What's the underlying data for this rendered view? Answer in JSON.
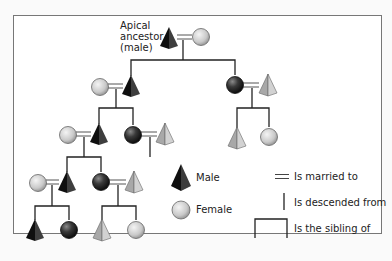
{
  "diagram": {
    "type": "kinship-descent-chart",
    "apical_label": [
      "Apical",
      "ancestor",
      "(male)"
    ],
    "colors": {
      "male_dark": "#1a1a1a",
      "male_light": "#bdbdbd",
      "female_light": "#d4d4d4",
      "female_dark": "#2e2e2e",
      "line": "#222222",
      "frame": "#777777"
    },
    "nodes": [
      {
        "id": "apex-m",
        "sex": "male",
        "shade": "dark",
        "x": 169,
        "y": 38
      },
      {
        "id": "apex-f",
        "sex": "female",
        "shade": "light",
        "x": 201,
        "y": 37
      },
      {
        "id": "g2-lf",
        "sex": "female",
        "shade": "light",
        "x": 100,
        "y": 87
      },
      {
        "id": "g2-lm",
        "sex": "male",
        "shade": "dark",
        "x": 131,
        "y": 86
      },
      {
        "id": "g2-rf",
        "sex": "female",
        "shade": "dark",
        "x": 235,
        "y": 85
      },
      {
        "id": "g2-rm",
        "sex": "male",
        "shade": "light",
        "x": 268,
        "y": 85
      },
      {
        "id": "g3-llf",
        "sex": "female",
        "shade": "light",
        "x": 68,
        "y": 135
      },
      {
        "id": "g3-llm",
        "sex": "male",
        "shade": "dark",
        "x": 99,
        "y": 134
      },
      {
        "id": "g3-lrf",
        "sex": "female",
        "shade": "dark",
        "x": 133,
        "y": 135
      },
      {
        "id": "g3-lrm",
        "sex": "male",
        "shade": "light",
        "x": 165,
        "y": 134
      },
      {
        "id": "g3-rm",
        "sex": "male",
        "shade": "light",
        "x": 237,
        "y": 138
      },
      {
        "id": "g3-rf",
        "sex": "female",
        "shade": "light",
        "x": 269,
        "y": 137
      },
      {
        "id": "g4-llf",
        "sex": "female",
        "shade": "light",
        "x": 38,
        "y": 183
      },
      {
        "id": "g4-llm",
        "sex": "male",
        "shade": "dark",
        "x": 67,
        "y": 182
      },
      {
        "id": "g4-lrf",
        "sex": "female",
        "shade": "dark",
        "x": 101,
        "y": 182
      },
      {
        "id": "g4-lrm",
        "sex": "male",
        "shade": "light",
        "x": 134,
        "y": 182
      },
      {
        "id": "g5-1m",
        "sex": "male",
        "shade": "dark",
        "x": 35,
        "y": 230
      },
      {
        "id": "g5-2f",
        "sex": "female",
        "shade": "dark",
        "x": 69,
        "y": 230
      },
      {
        "id": "g5-3m",
        "sex": "male",
        "shade": "light",
        "x": 102,
        "y": 230
      },
      {
        "id": "g5-4f",
        "sex": "female",
        "shade": "light",
        "x": 136,
        "y": 230
      }
    ],
    "marriages": [
      {
        "x1": 177,
        "x2": 192,
        "y": 37
      },
      {
        "x1": 108,
        "x2": 123,
        "y": 86
      },
      {
        "x1": 243,
        "x2": 259,
        "y": 85
      },
      {
        "x1": 76,
        "x2": 91,
        "y": 134
      },
      {
        "x1": 141,
        "x2": 157,
        "y": 134
      },
      {
        "x1": 46,
        "x2": 59,
        "y": 182
      },
      {
        "x1": 109,
        "x2": 126,
        "y": 182
      }
    ],
    "descents": [
      {
        "x": 183,
        "y1": 40,
        "y2": 60
      },
      {
        "x": 116,
        "y1": 89,
        "y2": 108
      },
      {
        "x": 252,
        "y1": 88,
        "y2": 108
      },
      {
        "x": 84,
        "y1": 137,
        "y2": 157
      },
      {
        "x": 150,
        "y1": 137,
        "y2": 157
      },
      {
        "x": 52,
        "y1": 185,
        "y2": 206
      },
      {
        "x": 118,
        "y1": 185,
        "y2": 206
      }
    ],
    "sibling_bars": [
      {
        "x1": 131,
        "x2": 235,
        "y": 60,
        "drop1": 76,
        "drop2": 75
      },
      {
        "x1": 99,
        "x2": 133,
        "y": 108,
        "drop1": 124,
        "drop2": 125
      },
      {
        "x1": 237,
        "x2": 269,
        "y": 108,
        "drop1": 128,
        "drop2": 127
      },
      {
        "x1": 67,
        "x2": 101,
        "y": 157,
        "drop1": 172,
        "drop2": 172
      },
      {
        "x1": 35,
        "x2": 69,
        "y": 206,
        "drop1": 220,
        "drop2": 220
      },
      {
        "x1": 102,
        "x2": 136,
        "y": 206,
        "drop1": 220,
        "drop2": 220
      }
    ]
  },
  "legend": {
    "male": "Male",
    "female": "Female",
    "married": "Is married to",
    "descended": "Is descended from",
    "sibling": "Is the sibling of"
  }
}
